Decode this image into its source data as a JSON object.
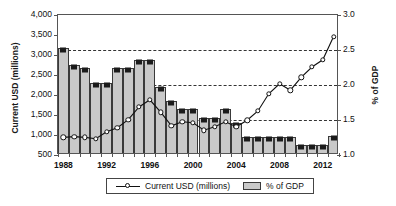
{
  "chart_data": {
    "type": "bar",
    "title": "",
    "xlabel": "",
    "ylabel": "Current USD (millions)",
    "y2label": "% of GDP",
    "grid": true,
    "legend_position": "bottom",
    "ylim": [
      500,
      4000
    ],
    "y2lim": [
      1.0,
      3.0
    ],
    "y_ticks": [
      "500",
      "1,000",
      "1,500",
      "2,000",
      "2,500",
      "3,000",
      "3,500",
      "4,000"
    ],
    "y_tick_values": [
      500,
      1000,
      1500,
      2000,
      2500,
      3000,
      3500,
      4000
    ],
    "y2_ticks": [
      "1.0",
      "1.5",
      "2.0",
      "2.5",
      "3.0"
    ],
    "y2_tick_values": [
      1.0,
      1.5,
      2.0,
      2.5,
      3.0
    ],
    "gridline_values_y2": [
      1.5,
      2.0,
      2.5
    ],
    "x_tick_labels": [
      "1988",
      "1992",
      "1996",
      "2000",
      "2004",
      "2008",
      "2012"
    ],
    "x_tick_values": [
      1988,
      1992,
      1996,
      2000,
      2004,
      2008,
      2012
    ],
    "categories": [
      1988,
      1989,
      1990,
      1991,
      1992,
      1993,
      1994,
      1995,
      1996,
      1997,
      1998,
      1999,
      2000,
      2001,
      2002,
      2003,
      2004,
      2005,
      2006,
      2007,
      2008,
      2009,
      2010,
      2011,
      2012,
      2013
    ],
    "series": [
      {
        "name": "% of GDP",
        "axis": "right",
        "render": "bar",
        "color": "#c9c9c9",
        "marker_color": "#1b1b1b",
        "values": [
          2.5,
          2.26,
          2.21,
          2.0,
          2.0,
          2.21,
          2.21,
          2.33,
          2.33,
          1.95,
          1.75,
          1.63,
          1.63,
          1.5,
          1.5,
          1.63,
          1.43,
          1.23,
          1.23,
          1.23,
          1.23,
          1.23,
          1.12,
          1.12,
          1.12,
          1.25
        ]
      },
      {
        "name": "Current USD (millions)",
        "axis": "left",
        "render": "line",
        "color": "#111111",
        "values": [
          940,
          960,
          940,
          905,
          1080,
          1180,
          1385,
          1700,
          1880,
          1570,
          1230,
          1330,
          1305,
          1120,
          1205,
          1330,
          1205,
          1370,
          1600,
          2030,
          2280,
          2120,
          2440,
          2700,
          2880,
          3460
        ]
      }
    ],
    "legend": [
      {
        "label": "Current USD (millions)",
        "marker": "line-circle-marker"
      },
      {
        "label": "% of GDP",
        "marker": "gray-bar-swatch"
      }
    ]
  }
}
